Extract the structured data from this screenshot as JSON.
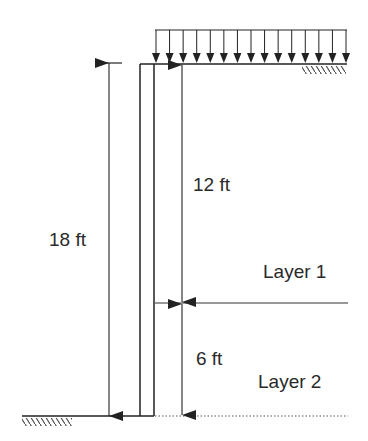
{
  "diagram": {
    "colors": {
      "line": "#222222",
      "background": "#ffffff"
    },
    "labels": {
      "total_height": "18 ft",
      "upper_depth": "12 ft",
      "lower_depth": "6 ft",
      "layer1": "Layer 1",
      "layer2": "Layer 2"
    },
    "surcharge": {
      "arrow_count": 15
    },
    "dimensions": [
      {
        "name": "total-height",
        "value": 18,
        "unit": "ft"
      },
      {
        "name": "layer1-thickness",
        "value": 12,
        "unit": "ft"
      },
      {
        "name": "layer2-thickness",
        "value": 6,
        "unit": "ft"
      }
    ]
  }
}
